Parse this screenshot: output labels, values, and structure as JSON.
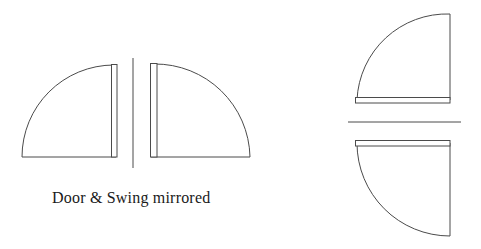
{
  "document": {
    "title": "Door & Swing mirrored",
    "background_color": "#ffffff",
    "line_color": "#4b4b4b",
    "text_color": "#1a1a1a",
    "width": 481,
    "height": 249
  },
  "caption": {
    "text": "Door & Swing mirrored"
  },
  "drawing": {
    "type": "architectural-door-swing-symbols",
    "symbol_count": 4,
    "symbols": [
      {
        "name": "door-swing-left-hand",
        "group": "left-pair",
        "position": "left",
        "hinge_corner": "top-right",
        "leaf_orientation": "vertical",
        "leaf_side": "right",
        "arc_sweep": "top-right to bottom-left",
        "radius": 92,
        "hinge_x": 114,
        "hinge_y": 65,
        "leaf_x1": 111,
        "leaf_x2": 117,
        "leaf_y1": 65,
        "leaf_y2": 157,
        "arc_end_x": 22,
        "arc_end_y": 157,
        "wall_line": "bottom"
      },
      {
        "name": "door-swing-right-hand",
        "group": "left-pair",
        "position": "right",
        "hinge_corner": "top-left",
        "leaf_orientation": "vertical",
        "leaf_side": "left",
        "arc_sweep": "top-left to bottom-right",
        "radius": 96,
        "hinge_x": 154,
        "hinge_y": 64,
        "leaf_x1": 150,
        "leaf_x2": 157,
        "leaf_y1": 64,
        "leaf_y2": 157,
        "arc_end_x": 250,
        "arc_end_y": 157,
        "wall_line": "bottom"
      },
      {
        "name": "door-swing-top-right",
        "group": "right-pair",
        "position": "top",
        "hinge_corner": "top-right",
        "leaf_orientation": "horizontal",
        "leaf_side": "bottom",
        "arc_sweep": "top-right to bottom-left",
        "radius": 86,
        "hinge_x": 450,
        "hinge_y": 14,
        "leaf_x1": 355,
        "leaf_x2": 450,
        "leaf_y1": 97,
        "leaf_y2": 103,
        "arc_end_x": 355,
        "arc_end_y": 100,
        "wall_line": "right"
      },
      {
        "name": "door-swing-bottom-right",
        "group": "right-pair",
        "position": "bottom",
        "hinge_corner": "bottom-right",
        "leaf_orientation": "horizontal",
        "leaf_side": "top",
        "arc_sweep": "top-left to bottom-right",
        "radius": 95,
        "hinge_x": 450,
        "hinge_y": 236,
        "leaf_x1": 355,
        "leaf_x2": 450,
        "leaf_y1": 140,
        "leaf_y2": 146,
        "arc_end_x": 355,
        "arc_end_y": 143,
        "wall_line": "right"
      }
    ],
    "separators": [
      {
        "name": "vertical-mirror-axis",
        "orientation": "vertical",
        "x": 133,
        "y1": 58,
        "y2": 168
      },
      {
        "name": "horizontal-mirror-axis",
        "orientation": "horizontal",
        "y": 122,
        "x1": 348,
        "x2": 461
      }
    ]
  }
}
